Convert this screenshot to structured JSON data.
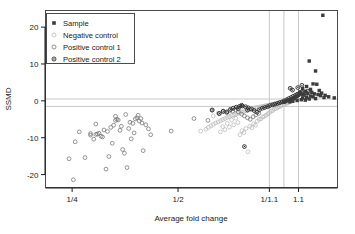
{
  "chart_data": {
    "type": "scatter",
    "title": "",
    "xlabel": "Average fold change",
    "ylabel": "SSMD",
    "grid": false,
    "legend_position": "top-left",
    "xscale": "log",
    "xtick_labels": [
      "1/4",
      "1/2",
      "1/1.1",
      "1.1"
    ],
    "xtick_values": [
      0.25,
      0.5,
      0.909,
      1.1
    ],
    "ytick_labels": [
      "20",
      "10",
      "0",
      "-10",
      "-20"
    ],
    "ytick_values": [
      20,
      10,
      0,
      -10,
      -20
    ],
    "xlim": [
      0.21,
      1.42
    ],
    "ylim": [
      -23.5,
      24.5
    ],
    "reference_lines": {
      "horizontal": [
        0.5,
        -1.5
      ],
      "vertical": [
        0.909,
        1.0,
        1.1
      ],
      "color": "#c8c8c8"
    },
    "series": [
      {
        "name": "Sample",
        "marker": "filled-square",
        "color": "#3c3c3c",
        "points": [
          [
            1.29,
            23.2
          ],
          [
            1.18,
            10.8
          ],
          [
            1.23,
            8.1
          ],
          [
            1.21,
            4.6
          ],
          [
            1.24,
            4.5
          ],
          [
            1.16,
            3.9
          ],
          [
            1.13,
            3.3
          ],
          [
            1.19,
            3.1
          ],
          [
            1.26,
            2.8
          ],
          [
            1.15,
            2.6
          ],
          [
            1.11,
            2.4
          ],
          [
            1.2,
            2.3
          ],
          [
            1.28,
            2.1
          ],
          [
            1.17,
            2.0
          ],
          [
            1.22,
            1.9
          ],
          [
            1.12,
            1.8
          ],
          [
            1.25,
            1.7
          ],
          [
            1.14,
            1.6
          ],
          [
            1.31,
            1.5
          ],
          [
            1.1,
            1.5
          ],
          [
            1.27,
            1.4
          ],
          [
            1.19,
            1.3
          ],
          [
            1.09,
            1.2
          ],
          [
            1.34,
            1.1
          ],
          [
            1.21,
            1.1
          ],
          [
            1.08,
            1.0
          ],
          [
            1.16,
            0.9
          ],
          [
            1.3,
            0.9
          ],
          [
            1.13,
            0.8
          ],
          [
            1.39,
            0.8
          ],
          [
            1.07,
            0.7
          ],
          [
            1.23,
            0.6
          ],
          [
            1.06,
            0.5
          ],
          [
            1.18,
            0.5
          ],
          [
            1.05,
            0.4
          ],
          [
            1.12,
            0.3
          ],
          [
            1.04,
            0.2
          ],
          [
            1.15,
            0.2
          ],
          [
            1.03,
            0.1
          ],
          [
            1.09,
            0.1
          ],
          [
            1.02,
            0.0
          ],
          [
            1.06,
            -0.1
          ],
          [
            1.01,
            -0.2
          ],
          [
            1.04,
            -0.3
          ],
          [
            1.0,
            -0.4
          ]
        ]
      },
      {
        "name": "Negative control",
        "marker": "open-circle-light",
        "color": "#b4b4b4",
        "points": [
          [
            0.99,
            -0.2
          ],
          [
            0.98,
            -0.4
          ],
          [
            0.97,
            -0.5
          ],
          [
            0.96,
            -0.6
          ],
          [
            0.95,
            -0.7
          ],
          [
            0.94,
            -0.8
          ],
          [
            0.93,
            -0.9
          ],
          [
            0.92,
            -1.0
          ],
          [
            0.91,
            -1.1
          ],
          [
            0.9,
            -1.2
          ],
          [
            0.89,
            -1.3
          ],
          [
            0.88,
            -1.4
          ],
          [
            0.87,
            -1.5
          ],
          [
            0.86,
            -1.6
          ],
          [
            0.85,
            -1.7
          ],
          [
            0.84,
            -1.8
          ],
          [
            0.83,
            -1.9
          ],
          [
            0.82,
            -2.0
          ],
          [
            0.81,
            -2.2
          ],
          [
            0.8,
            -2.4
          ],
          [
            0.79,
            -2.5
          ],
          [
            0.78,
            -2.7
          ],
          [
            0.77,
            -2.9
          ],
          [
            0.76,
            -3.0
          ],
          [
            0.75,
            -3.2
          ],
          [
            0.74,
            -3.4
          ],
          [
            0.73,
            -3.6
          ],
          [
            0.72,
            -3.8
          ],
          [
            0.71,
            -4.0
          ],
          [
            0.7,
            -4.3
          ],
          [
            0.69,
            -4.5
          ],
          [
            0.68,
            -4.8
          ],
          [
            0.67,
            -5.1
          ],
          [
            0.66,
            -5.4
          ],
          [
            0.65,
            -5.7
          ],
          [
            0.64,
            -6.0
          ],
          [
            0.63,
            -6.4
          ],
          [
            0.62,
            -6.8
          ],
          [
            0.61,
            -7.2
          ],
          [
            0.6,
            -7.7
          ],
          [
            0.9,
            -3.5
          ],
          [
            0.88,
            -4.2
          ],
          [
            0.86,
            -4.9
          ],
          [
            0.84,
            -5.5
          ],
          [
            0.82,
            -6.2
          ],
          [
            0.8,
            -6.9
          ],
          [
            0.78,
            -7.5
          ],
          [
            0.76,
            -8.1
          ],
          [
            0.92,
            -2.8
          ],
          [
            0.94,
            -2.2
          ],
          [
            0.96,
            -1.8
          ],
          [
            0.98,
            -1.4
          ],
          [
            0.79,
            -13.8
          ],
          [
            0.58,
            -8.2
          ],
          [
            0.72,
            -6.5
          ],
          [
            0.7,
            -7.1
          ],
          [
            0.68,
            -7.8
          ],
          [
            0.66,
            -8.4
          ],
          [
            0.74,
            -5.9
          ],
          [
            0.85,
            -5.0
          ],
          [
            0.87,
            -4.4
          ],
          [
            0.89,
            -3.9
          ],
          [
            0.91,
            -3.2
          ],
          [
            0.93,
            -2.6
          ],
          [
            0.95,
            -2.1
          ],
          [
            0.97,
            -1.6
          ],
          [
            1.0,
            -1.0
          ],
          [
            1.01,
            -0.8
          ],
          [
            1.02,
            -0.6
          ],
          [
            1.03,
            -0.5
          ],
          [
            0.83,
            -6.6
          ],
          [
            0.81,
            -7.3
          ],
          [
            0.77,
            -8.6
          ],
          [
            0.75,
            -9.2
          ],
          [
            0.73,
            -4.7
          ],
          [
            0.71,
            -5.2
          ],
          [
            0.69,
            -6.1
          ],
          [
            0.67,
            -7.0
          ],
          [
            0.65,
            -3.3
          ],
          [
            0.63,
            -4.1
          ]
        ]
      },
      {
        "name": "Positive control 1",
        "marker": "open-circle",
        "color": "#787878",
        "points": [
          [
            0.245,
            -15.7
          ],
          [
            0.255,
            -11.1
          ],
          [
            0.252,
            -21.4
          ],
          [
            0.262,
            -8.4
          ],
          [
            0.272,
            -15.4
          ],
          [
            0.282,
            -9.3
          ],
          [
            0.288,
            -10.4
          ],
          [
            0.292,
            -9.1
          ],
          [
            0.295,
            -9.0
          ],
          [
            0.298,
            -8.8
          ],
          [
            0.302,
            -9.6
          ],
          [
            0.308,
            -7.9
          ],
          [
            0.312,
            -18.5
          ],
          [
            0.318,
            -15.1
          ],
          [
            0.322,
            -7.2
          ],
          [
            0.328,
            -6.6
          ],
          [
            0.332,
            -5.3
          ],
          [
            0.335,
            -5.0
          ],
          [
            0.338,
            -5.2
          ],
          [
            0.342,
            -8.0
          ],
          [
            0.348,
            -13.2
          ],
          [
            0.352,
            -14.2
          ],
          [
            0.358,
            -18.1
          ],
          [
            0.362,
            -7.5
          ],
          [
            0.368,
            -10.3
          ],
          [
            0.372,
            -6.1
          ],
          [
            0.378,
            -4.9
          ],
          [
            0.382,
            -4.6
          ],
          [
            0.388,
            -5.5
          ],
          [
            0.392,
            -4.8
          ],
          [
            0.398,
            -13.5
          ],
          [
            0.405,
            -6.5
          ],
          [
            0.412,
            -7.6
          ],
          [
            0.418,
            -9.2
          ],
          [
            0.282,
            -8.9
          ],
          [
            0.305,
            -9.8
          ],
          [
            0.325,
            -11.5
          ],
          [
            0.345,
            -6.9
          ],
          [
            0.365,
            -5.8
          ],
          [
            0.385,
            -3.9
          ],
          [
            0.332,
            -4.2
          ],
          [
            0.355,
            -3.7
          ],
          [
            0.292,
            -6.3
          ],
          [
            0.315,
            -8.3
          ],
          [
            0.375,
            -8.7
          ],
          [
            0.395,
            -6.0
          ],
          [
            0.478,
            -8.2
          ],
          [
            0.555,
            -4.8
          ],
          [
            0.608,
            -5.3
          ],
          [
            0.625,
            -2.5
          ],
          [
            0.655,
            -3.5
          ],
          [
            0.672,
            -2.9
          ],
          [
            0.688,
            -3.2
          ],
          [
            0.702,
            -2.6
          ],
          [
            0.715,
            -2.8
          ],
          [
            0.728,
            -2.4
          ],
          [
            0.742,
            -3.0
          ],
          [
            0.758,
            -3.6
          ],
          [
            0.772,
            -4.1
          ],
          [
            0.788,
            -4.6
          ],
          [
            0.802,
            -5.0
          ],
          [
            0.818,
            -4.3
          ],
          [
            0.832,
            -3.8
          ],
          [
            0.848,
            -3.4
          ]
        ]
      },
      {
        "name": "Positive control 2",
        "marker": "circle-dot",
        "color": "#282828",
        "points": [
          [
            0.625,
            -2.5
          ],
          [
            0.655,
            -3.4
          ],
          [
            0.672,
            -2.8
          ],
          [
            0.688,
            -3.0
          ],
          [
            0.705,
            -2.3
          ],
          [
            0.718,
            -2.0
          ],
          [
            0.732,
            -1.7
          ],
          [
            0.748,
            -1.5
          ],
          [
            0.762,
            -1.4
          ],
          [
            0.778,
            -1.6
          ],
          [
            0.792,
            -1.9
          ],
          [
            0.808,
            -2.2
          ],
          [
            0.822,
            -2.6
          ],
          [
            0.838,
            -3.1
          ],
          [
            0.852,
            -2.4
          ],
          [
            0.868,
            -2.0
          ],
          [
            0.882,
            -1.8
          ],
          [
            0.898,
            -1.6
          ],
          [
            0.912,
            -1.3
          ],
          [
            0.928,
            -1.1
          ],
          [
            0.942,
            -0.9
          ],
          [
            0.958,
            -0.7
          ],
          [
            0.972,
            -0.5
          ],
          [
            0.988,
            -0.3
          ],
          [
            1.002,
            0.0
          ],
          [
            1.018,
            0.3
          ],
          [
            1.032,
            0.6
          ],
          [
            1.048,
            0.9
          ],
          [
            1.062,
            1.2
          ],
          [
            1.078,
            1.5
          ],
          [
            1.092,
            1.8
          ],
          [
            1.108,
            2.1
          ],
          [
            1.122,
            2.4
          ],
          [
            1.138,
            2.0
          ],
          [
            1.152,
            1.7
          ],
          [
            1.168,
            2.6
          ],
          [
            0.772,
            -12.4
          ],
          [
            0.742,
            -2.1
          ],
          [
            0.758,
            -1.2
          ],
          [
            0.788,
            -2.5
          ],
          [
            1.042,
            3.4
          ],
          [
            1.058,
            2.9
          ],
          [
            1.095,
            3.6
          ],
          [
            1.125,
            4.2
          ]
        ]
      }
    ]
  },
  "legend": {
    "items": [
      {
        "label": "Sample"
      },
      {
        "label": "Negative control"
      },
      {
        "label": "Positive control 1"
      },
      {
        "label": "Positive control 2"
      }
    ]
  },
  "axes": {
    "x_title": "Average fold change",
    "y_title": "SSMD"
  }
}
